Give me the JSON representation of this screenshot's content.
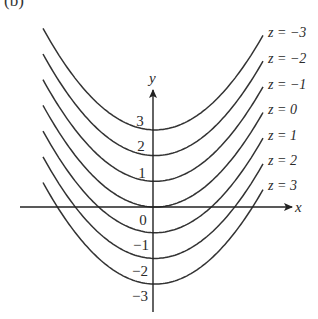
{
  "figure": {
    "panel_label": "(b)",
    "x_axis_label": "x",
    "y_axis_label": "y",
    "y_tick_labels": [
      "3",
      "2",
      "1",
      "0",
      "−1",
      "−2",
      "−3"
    ],
    "level_curve_labels": [
      "z = −3",
      "z = −2",
      "z = −1",
      "z = 0",
      "z = 1",
      "z = 2",
      "z = 3"
    ],
    "line_color": "#333333"
  },
  "chart_data": {
    "type": "line",
    "xlabel": "x",
    "ylabel": "y",
    "series": [
      {
        "name": "z = -3",
        "vertex_y": 3
      },
      {
        "name": "z = -2",
        "vertex_y": 2
      },
      {
        "name": "z = -1",
        "vertex_y": 1
      },
      {
        "name": "z = 0",
        "vertex_y": 0
      },
      {
        "name": "z = 1",
        "vertex_y": -1
      },
      {
        "name": "z = 2",
        "vertex_y": -2
      },
      {
        "name": "z = 3",
        "vertex_y": -3
      }
    ],
    "y_ticks": [
      3,
      2,
      1,
      0,
      -1,
      -2,
      -3
    ],
    "grid": false,
    "legend_position": "right (inline labels)"
  }
}
